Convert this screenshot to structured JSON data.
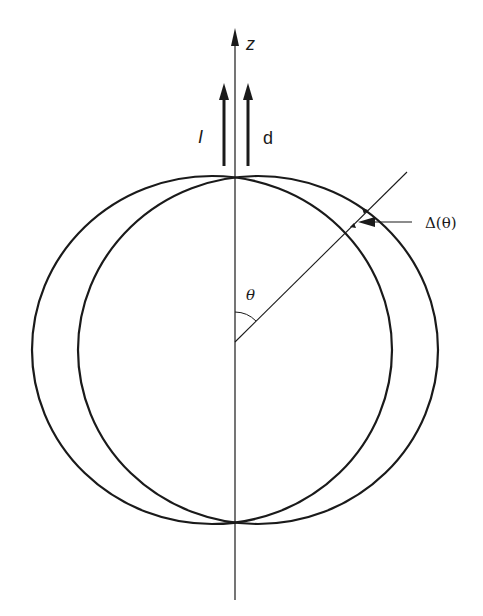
{
  "diagram": {
    "axis_label": "z",
    "arrow_labels": {
      "left": "I",
      "right": "d"
    },
    "angle_label": "θ",
    "delta_label": "Δ(θ)",
    "stroke_color": "#1a1a1a",
    "background": "#ffffff"
  }
}
